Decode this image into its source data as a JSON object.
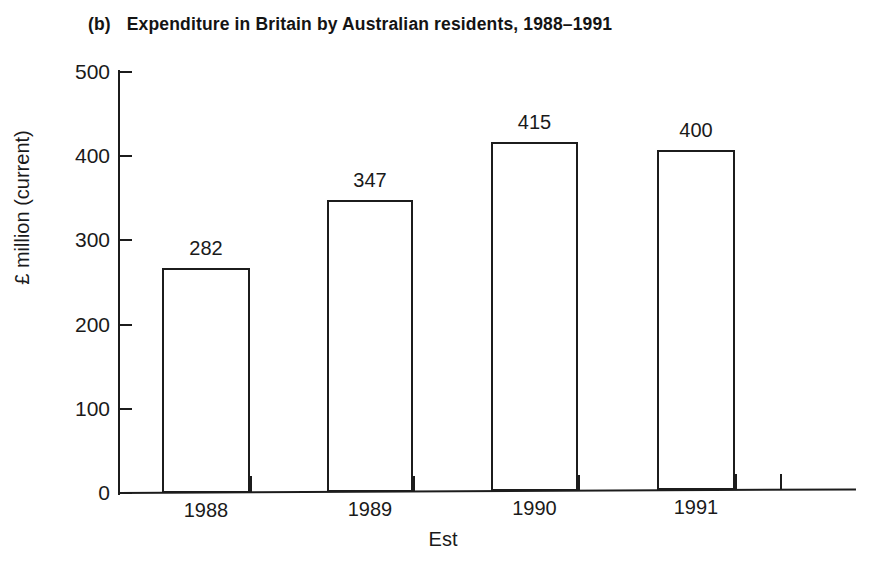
{
  "chart_data": {
    "type": "bar",
    "panel_letter": "(b)",
    "title": "Expenditure in Britain by Australian residents, 1988–1991",
    "categories": [
      "1988",
      "1989",
      "1990",
      "1991"
    ],
    "values": [
      282,
      347,
      415,
      400
    ],
    "value_labels": [
      "282",
      "347",
      "415",
      "400"
    ],
    "xlabel": "Est",
    "ylabel": "£ million (current)",
    "ylim": [
      0,
      500
    ],
    "ytick_labels": [
      "0",
      "100",
      "200",
      "300",
      "400",
      "500"
    ],
    "ytick_values": [
      0,
      100,
      200,
      300,
      400,
      500
    ],
    "grid": false,
    "legend": null,
    "bar_fill": "#ffffff",
    "bar_edge": "#1c1c1c",
    "background": "#ffffff"
  }
}
